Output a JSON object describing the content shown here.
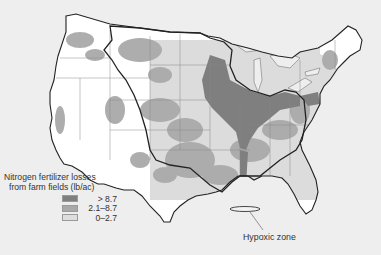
{
  "map": {
    "subject": "Contiguous United States",
    "background_color": "#eeeeee",
    "land_color": "#ffffff",
    "border_color": "#222222",
    "watershed_boundary": "Mississippi River basin (thick outline)",
    "legend": {
      "title_line1": "Nitrogen fertilizer losses",
      "title_line2": "from farm fields (lb/ac)",
      "items": [
        {
          "label": "> 8.7",
          "color": "#7f7f7f"
        },
        {
          "label": "2.1–8.7",
          "color": "#a9a9a9"
        },
        {
          "label": "0–2.7",
          "color": "#dedede"
        }
      ]
    },
    "annotations": [
      {
        "label": "Hypoxic zone",
        "location": "Gulf of Mexico off Louisiana coast"
      }
    ]
  }
}
